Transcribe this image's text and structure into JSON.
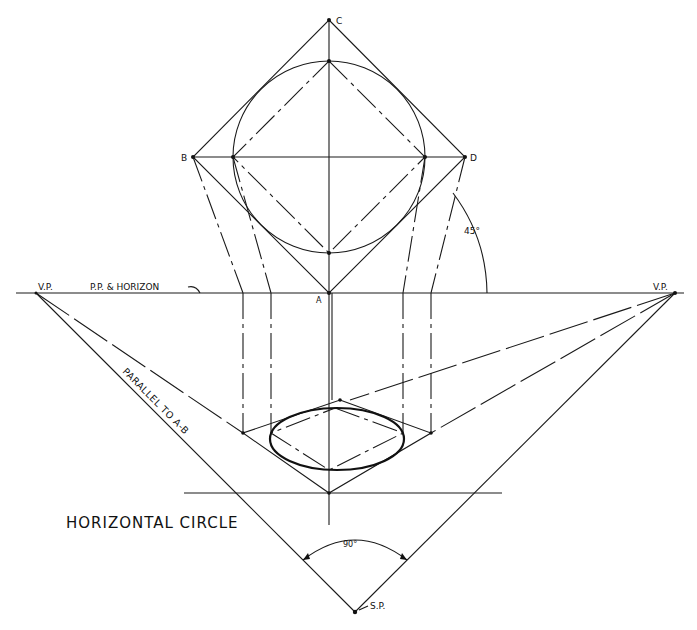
{
  "figure": {
    "title": "HORIZONTAL CIRCLE",
    "labels": {
      "point_c": "C",
      "point_b": "B",
      "point_d": "D",
      "point_a": "A",
      "vp_left": "V.P.",
      "vp_right": "V.P.",
      "horizon": "P.P. & HORIZON",
      "sp": "S.P.",
      "angle_45": "45°",
      "angle_90": "90°",
      "parallel_note": "PARALLEL TO A-B"
    },
    "colors": {
      "ink": "#1a1a1a",
      "paper": "#ffffff"
    }
  }
}
